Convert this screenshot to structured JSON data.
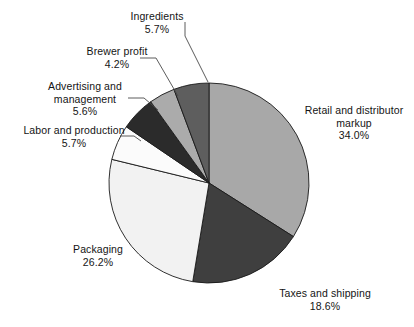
{
  "chart_data": {
    "type": "pie",
    "title": "",
    "subtitle": "",
    "xlabel": "",
    "ylabel": "",
    "legend_position": "none",
    "grid": false,
    "units": "percent",
    "start_angle_deg": 0,
    "direction": "clockwise",
    "categories": [
      "Retail and distributor markup",
      "Taxes and shipping",
      "Packaging",
      "Labor and production",
      "Advertising and management",
      "Brewer profit",
      "Ingredients"
    ],
    "values": [
      34.0,
      18.6,
      26.2,
      5.7,
      5.6,
      4.2,
      5.7
    ],
    "slices": [
      {
        "label": "Retail and distributor markup",
        "label_line1": "Retail and distributor",
        "label_line2": "markup",
        "value": 34.0,
        "value_text": "34.0%",
        "color": "#a8a8a8"
      },
      {
        "label": "Taxes and shipping",
        "label_line1": "Taxes and shipping",
        "label_line2": "",
        "value": 18.6,
        "value_text": "18.6%",
        "color": "#3f3f3f"
      },
      {
        "label": "Packaging",
        "label_line1": "Packaging",
        "label_line2": "",
        "value": 26.2,
        "value_text": "26.2%",
        "color": "#f2f2f2"
      },
      {
        "label": "Labor and production",
        "label_line1": "Labor and production",
        "label_line2": "",
        "value": 5.7,
        "value_text": "5.7%",
        "color": "#fbfbfb"
      },
      {
        "label": "Advertising and management",
        "label_line1": "Advertising and",
        "label_line2": "management",
        "value": 5.6,
        "value_text": "5.6%",
        "color": "#2b2b2b"
      },
      {
        "label": "Brewer profit",
        "label_line1": "Brewer profit",
        "label_line2": "",
        "value": 4.2,
        "value_text": "4.2%",
        "color": "#ababab"
      },
      {
        "label": "Ingredients",
        "label_line1": "Ingredients",
        "label_line2": "",
        "value": 5.7,
        "value_text": "5.7%",
        "color": "#5e5e5e"
      }
    ]
  },
  "colors": {
    "outline": "#1a1a1a",
    "leader_line": "#4a4a4a",
    "text": "#141414",
    "background": "#ffffff"
  }
}
